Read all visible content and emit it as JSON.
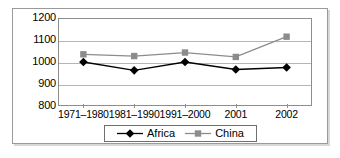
{
  "chart_data": {
    "type": "line",
    "title": "",
    "xlabel": "",
    "ylabel": "",
    "categories": [
      "1971–1980",
      "1981–1990",
      "1991–2000",
      "2001",
      "2002"
    ],
    "series": [
      {
        "name": "Africa",
        "values": [
          1000,
          962,
          1000,
          966,
          975
        ],
        "color": "#000000",
        "marker": "diamond"
      },
      {
        "name": "China",
        "values": [
          1035,
          1027,
          1043,
          1023,
          1115
        ],
        "color": "#8c8c8c",
        "marker": "square"
      }
    ],
    "ylim": [
      800,
      1200
    ],
    "yticks": [
      800,
      900,
      1000,
      1100,
      1200
    ],
    "ytick_labels": [
      "800",
      "900",
      "1000",
      "1100",
      "1200"
    ],
    "grid": true,
    "legend_position": "bottom"
  },
  "legend": {
    "entries": [
      {
        "label": "Africa"
      },
      {
        "label": "China"
      }
    ]
  },
  "colors": {
    "africa": "#000000",
    "china": "#8c8c8c",
    "gridline": "#b5b5b5",
    "axis": "#8d8d8d",
    "frame": "#9a9a9a",
    "text": "#000000"
  }
}
